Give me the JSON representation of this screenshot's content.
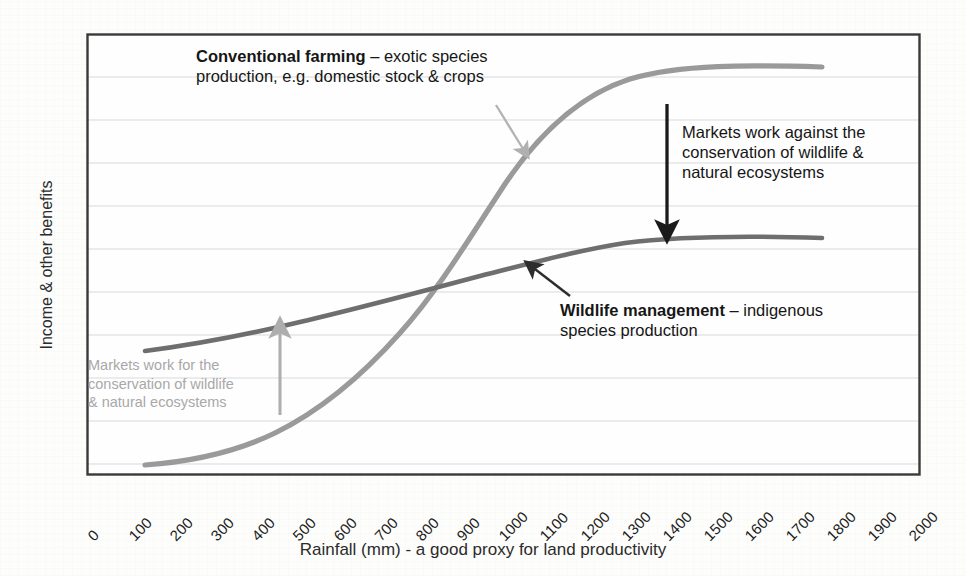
{
  "chart_data": {
    "type": "line",
    "title": "",
    "xlabel": "Rainfall (mm) - a good proxy for land productivity",
    "ylabel": "Income & other benefits",
    "xlim": [
      0,
      2000
    ],
    "ylim": [
      0,
      100
    ],
    "grid": true,
    "legend": "none",
    "xticks": [
      "0",
      "100",
      "200",
      "300",
      "400",
      "500",
      "600",
      "700",
      "800",
      "900",
      "1000",
      "1100",
      "1200",
      "1300",
      "1400",
      "1500",
      "1600",
      "1700",
      "1800",
      "1900",
      "2000"
    ],
    "yticks": [],
    "series": [
      {
        "name": "Conventional farming",
        "color": "#9a9a9a",
        "x": [
          150,
          300,
          450,
          600,
          700,
          800,
          900,
          1000,
          1100,
          1200,
          1300,
          1400,
          1500,
          1600,
          1700,
          1800
        ],
        "values": [
          2,
          7,
          16,
          29,
          40,
          52,
          64,
          74,
          81,
          86,
          90,
          92.5,
          93.8,
          94.6,
          95.2,
          95.6
        ]
      },
      {
        "name": "Wildlife management",
        "color": "#6e6e6e",
        "x": [
          150,
          300,
          450,
          600,
          700,
          800,
          900,
          1000,
          1100,
          1200,
          1300,
          1400,
          1500,
          1600,
          1700,
          1800
        ],
        "values": [
          28,
          34,
          40,
          46,
          50,
          54,
          58,
          61,
          63.5,
          65,
          66,
          66.8,
          67.3,
          67.6,
          67.8,
          68
        ]
      }
    ],
    "annotations": [
      {
        "id": "conventional",
        "bold": "Conventional farming",
        "rest": " – exotic species",
        "line2": "production, e.g. domestic stock & crops",
        "tone": "dark"
      },
      {
        "id": "markets-against",
        "line1": "Markets work against the",
        "line2": "conservation of wildlife &",
        "line3": "natural ecosystems",
        "tone": "dark"
      },
      {
        "id": "wildlife",
        "bold": "Wildlife management",
        "rest": " – indigenous",
        "line2": "species production",
        "tone": "dark"
      },
      {
        "id": "markets-for",
        "line1": "Markets work for the",
        "line2": "conservation of wildlife",
        "line3": "& natural ecosystems",
        "tone": "light"
      }
    ],
    "arrows": [
      {
        "name": "arrow-to-conventional-curve",
        "color": "#b3b3b3",
        "direction": "down-right"
      },
      {
        "name": "arrow-markets-against",
        "color": "#1a1a1a",
        "direction": "down"
      },
      {
        "name": "arrow-to-wildlife-curve",
        "color": "#2d2d2d",
        "direction": "up-left"
      },
      {
        "name": "arrow-markets-for",
        "color": "#adadad",
        "direction": "up"
      }
    ]
  },
  "axis": {
    "x_title": "Rainfall (mm) - a good proxy for land productivity",
    "y_title": "Income & other benefits",
    "ticks": [
      "0",
      "100",
      "200",
      "300",
      "400",
      "500",
      "600",
      "700",
      "800",
      "900",
      "1000",
      "1100",
      "1200",
      "1300",
      "1400",
      "1500",
      "1600",
      "1700",
      "1800",
      "1900",
      "2000"
    ]
  },
  "annotations": {
    "conventional": {
      "bold": "Conventional farming",
      "rest": " – exotic species",
      "line2": "production, e.g. domestic stock & crops"
    },
    "markets_against": {
      "line1": "Markets work against the",
      "line2": "conservation of wildlife &",
      "line3": "natural ecosystems"
    },
    "wildlife": {
      "bold": "Wildlife management",
      "rest": " – indigenous",
      "line2": "species production"
    },
    "markets_for": {
      "line1": "Markets work for the",
      "line2": "conservation of wildlife",
      "line3": "& natural ecosystems"
    }
  },
  "colors": {
    "conventional_curve": "#9a9a9a",
    "wildlife_curve": "#6e6e6e",
    "frame": "#3a3a3a",
    "gridline": "#d8d8d8",
    "dark_text": "#161616",
    "light_text": "#a8a8a8"
  }
}
